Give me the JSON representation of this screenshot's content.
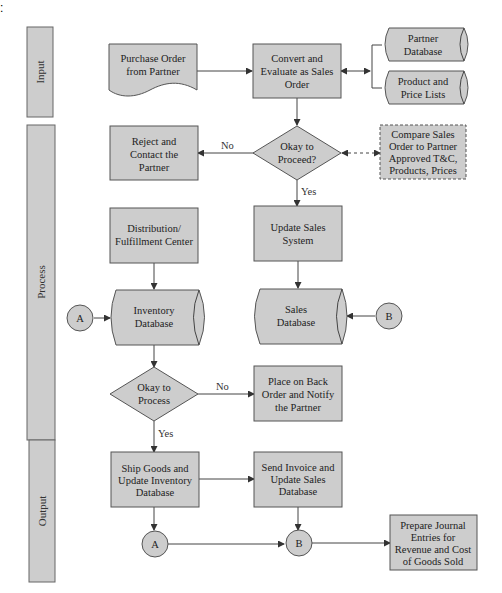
{
  "figure_marker": ":",
  "lanes": [
    {
      "label": "Input"
    },
    {
      "label": "Process"
    },
    {
      "label": "Output"
    }
  ],
  "nodes": {
    "purchase_order": [
      "Purchase Order",
      "from Partner"
    ],
    "convert_evaluate": [
      "Convert and",
      "Evaluate as Sales",
      "Order"
    ],
    "partner_db": [
      "Partner",
      "Database"
    ],
    "product_price": [
      "Product and",
      "Price Lists"
    ],
    "reject": [
      "Reject and",
      "Contact the",
      "Partner"
    ],
    "okay_proceed": [
      "Okay to",
      "Proceed?"
    ],
    "compare": [
      "Compare Sales",
      "Order to Partner",
      "Approved T&C,",
      "Products, Prices"
    ],
    "distribution": [
      "Distribution/",
      "Fulfillment Center"
    ],
    "update_sales_system": [
      "Update Sales",
      "System"
    ],
    "inventory_db": [
      "Inventory",
      "Database"
    ],
    "sales_db": [
      "Sales",
      "Database"
    ],
    "connector_a_top": "A",
    "connector_b_top": "B",
    "okay_process": [
      "Okay to",
      "Process"
    ],
    "back_order": [
      "Place on Back",
      "Order and Notify",
      "the Partner"
    ],
    "ship_goods": [
      "Ship Goods and",
      "Update Inventory",
      "Database"
    ],
    "send_invoice": [
      "Send Invoice and",
      "Update Sales",
      "Database"
    ],
    "connector_a_bottom": "A",
    "connector_b_bottom": "B",
    "journal": [
      "Prepare Journal",
      "Entries for",
      "Revenue and Cost",
      "of Goods Sold"
    ]
  },
  "edge_labels": {
    "proceed_no": "No",
    "proceed_yes": "Yes",
    "process_no": "No",
    "process_yes": "Yes"
  },
  "colors": {
    "shape_fill": "#cdcdcd",
    "stroke": "#555555",
    "text": "#222222"
  }
}
